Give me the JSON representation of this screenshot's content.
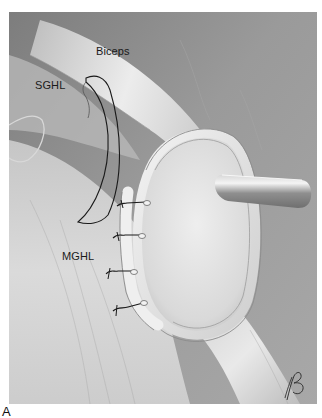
{
  "figure": {
    "panel_letter": "A",
    "labels": {
      "biceps": "Biceps",
      "sghl": "SGHL",
      "mghl": "MGHL"
    },
    "sutures": [
      {
        "x": 124,
        "y": 203
      },
      {
        "x": 134,
        "y": 236
      },
      {
        "x": 133,
        "y": 272
      },
      {
        "x": 139,
        "y": 305
      }
    ],
    "artist_signature": "RB",
    "colors": {
      "background_dark": "#8f8f8f",
      "tissue_light": "#e6e6e6",
      "outline": "#1a1a1a",
      "instrument": "#b5b5b5"
    }
  }
}
